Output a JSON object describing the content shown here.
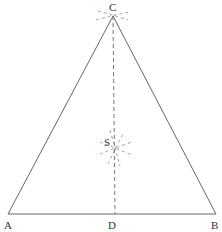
{
  "diagram": {
    "type": "geometric-construction",
    "shape": "isosceles triangle",
    "points": {
      "A": {
        "label": "A",
        "x": 8,
        "y": 214
      },
      "B": {
        "label": "B",
        "x": 216,
        "y": 214
      },
      "C": {
        "label": "C",
        "x": 113,
        "y": 16
      },
      "D": {
        "label": "D",
        "x": 113,
        "y": 214
      },
      "S": {
        "label": "S",
        "x": 115,
        "y": 148
      }
    },
    "segments": [
      {
        "from": "A",
        "to": "B",
        "style": "solid"
      },
      {
        "from": "A",
        "to": "C",
        "style": "solid"
      },
      {
        "from": "B",
        "to": "C",
        "style": "solid"
      },
      {
        "from": "C",
        "to": "D",
        "style": "dashed"
      }
    ],
    "construction_marks": [
      {
        "at": "C",
        "description": "dashed arc marks through apex"
      },
      {
        "at": "S",
        "description": "dashed intersecting arcs marking point S"
      }
    ],
    "colors": {
      "line": "#555555",
      "dash": "#777777",
      "label": "#333333"
    }
  }
}
